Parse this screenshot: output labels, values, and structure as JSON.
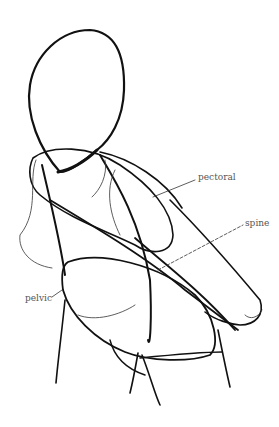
{
  "diagram": {
    "type": "figure-sketch",
    "labels": {
      "pectoral": "pectoral",
      "spine": "spine",
      "pelvic": "pelvic"
    },
    "colors": {
      "line": "#111111",
      "label": "#555555",
      "background": "#ffffff"
    }
  }
}
